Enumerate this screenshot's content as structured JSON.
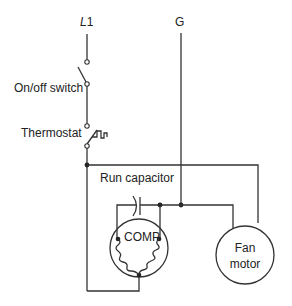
{
  "diagram": {
    "labels": {
      "l1_prefix": "L",
      "l1_suffix": "1",
      "ground": "G",
      "onoff_switch": "On/off switch",
      "thermostat": "Thermostat",
      "run_capacitor": "Run capacitor",
      "compressor": "COMP",
      "fan_motor_line1": "Fan",
      "fan_motor_line2": "motor"
    },
    "components": [
      {
        "id": "l1",
        "type": "supply-line",
        "label": "L1"
      },
      {
        "id": "ground",
        "type": "ground-line",
        "label": "G"
      },
      {
        "id": "onoff-switch",
        "type": "switch",
        "state": "open",
        "label": "On/off switch"
      },
      {
        "id": "thermostat",
        "type": "thermostat-switch",
        "state": "open",
        "label": "Thermostat"
      },
      {
        "id": "run-capacitor",
        "type": "capacitor",
        "label": "Run capacitor"
      },
      {
        "id": "compressor",
        "type": "motor",
        "label": "COMP"
      },
      {
        "id": "fan-motor",
        "type": "motor",
        "label": "Fan motor"
      }
    ]
  }
}
